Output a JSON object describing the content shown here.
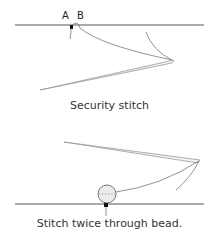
{
  "figure1": {
    "label_a": "A",
    "label_b": "B",
    "caption": "Security stitch"
  },
  "figure2": {
    "caption": "Stitch twice through bead."
  },
  "colors": {
    "line": "#555555",
    "needle": "#aaaaaa",
    "thread": "#777777"
  }
}
